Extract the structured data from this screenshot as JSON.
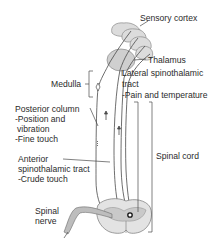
{
  "diagram": {
    "type": "anatomical-pathway",
    "labels": {
      "sensory_cortex": "Sensory cortex",
      "thalamus": "Thalamus",
      "medulla": "Medulla",
      "lateral_tract_l1": "Lateral spinothalamic",
      "lateral_tract_l2": "tract",
      "lateral_tract_l3": "-Pain and temperature",
      "posterior_l1": "Posterior column",
      "posterior_l2": "-Position and",
      "posterior_l3": "vibration",
      "posterior_l4": "-Fine touch",
      "anterior_l1": "Anterior",
      "anterior_l2": "spinothalamic tract",
      "anterior_l3": "-Crude touch",
      "spinal_cord": "Spinal cord",
      "spinal_nerve_l1": "Spinal",
      "spinal_nerve_l2": "nerve"
    },
    "colors": {
      "line": "#4a4a4a",
      "tissue_fill": "#d9d9d9",
      "tissue_shade": "#b8b8b8",
      "background": "#ffffff"
    }
  }
}
